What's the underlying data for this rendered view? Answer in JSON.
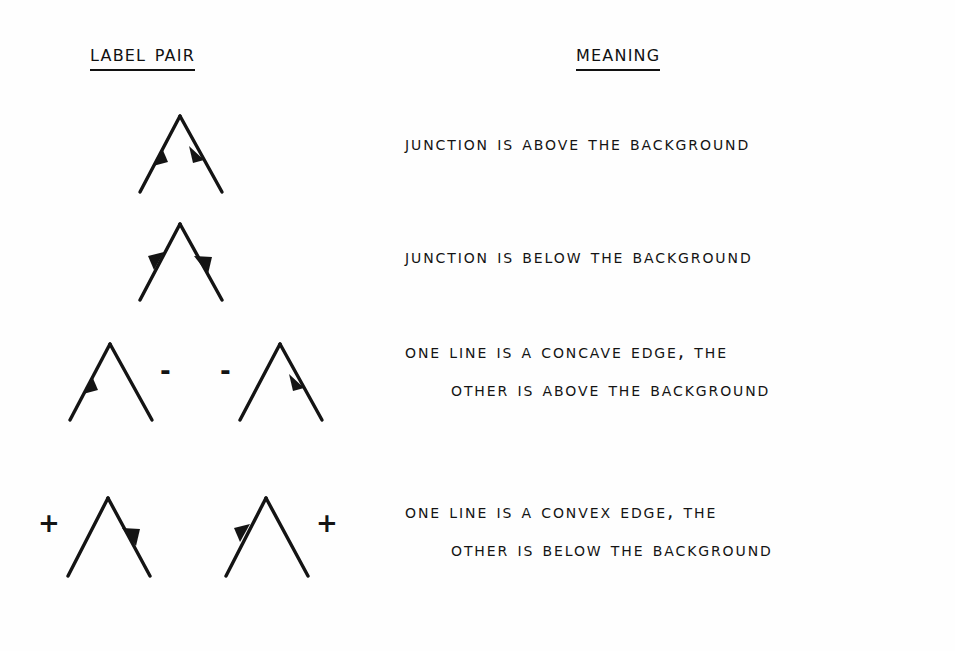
{
  "page": {
    "background_color": "#fefefe",
    "ink_color": "#141414"
  },
  "headers": {
    "label_pair": "Label Pair",
    "meaning": "Meaning"
  },
  "rows": [
    {
      "id": "row-1",
      "meaning_line_1": "Junction is above the background",
      "meaning_line_2": "",
      "figures": [
        {
          "id": "fig-1a",
          "left_leg_arrow": "toward-apex",
          "right_leg_arrow": "away-from-apex",
          "left_sign": "",
          "right_sign": ""
        }
      ]
    },
    {
      "id": "row-2",
      "meaning_line_1": "Junction is below the background",
      "meaning_line_2": "",
      "figures": [
        {
          "id": "fig-2a",
          "left_leg_arrow": "away-from-apex",
          "right_leg_arrow": "toward-apex",
          "left_sign": "",
          "right_sign": ""
        }
      ]
    },
    {
      "id": "row-3",
      "meaning_line_1": "One line is a concave edge, the",
      "meaning_line_2": "other is above the background",
      "figures": [
        {
          "id": "fig-3a",
          "left_leg_arrow": "toward-apex",
          "right_leg_arrow": "none",
          "left_sign": "",
          "right_sign": "-"
        },
        {
          "id": "fig-3b",
          "left_leg_arrow": "none",
          "right_leg_arrow": "away-from-apex",
          "left_sign": "-",
          "right_sign": ""
        }
      ]
    },
    {
      "id": "row-4",
      "meaning_line_1": "One line is a convex edge, the",
      "meaning_line_2": "other is below the background",
      "figures": [
        {
          "id": "fig-4a",
          "left_leg_arrow": "none",
          "right_leg_arrow": "toward-apex",
          "left_sign": "+",
          "right_sign": ""
        },
        {
          "id": "fig-4b",
          "left_leg_arrow": "away-from-apex",
          "right_leg_arrow": "none",
          "left_sign": "",
          "right_sign": "+"
        }
      ]
    }
  ]
}
